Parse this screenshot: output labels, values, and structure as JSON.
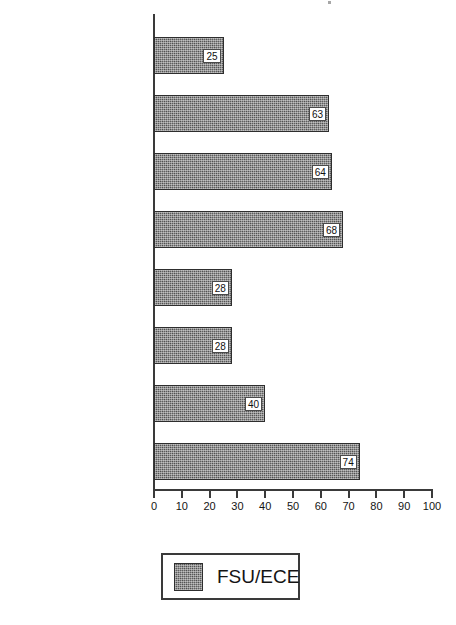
{
  "chart_data": {
    "type": "bar",
    "orientation": "horizontal",
    "title": "",
    "xlabel": "",
    "ylabel": "",
    "categories": [
      "Party values",
      "Electoral values",
      "Populist values",
      "Liberal values",
      "Cultural nationalism",
      "Centralist nationalism",
      "External nationalism",
      "Socialist values"
    ],
    "series": [
      {
        "name": "FSU/ECE",
        "values": [
          25,
          63,
          64,
          68,
          28,
          28,
          40,
          74
        ],
        "color": "#5f5f5f"
      }
    ],
    "values": [
      25,
      63,
      64,
      68,
      28,
      28,
      40,
      74
    ],
    "xlim": [
      0,
      100
    ],
    "xticks": [
      0,
      10,
      20,
      30,
      40,
      50,
      60,
      70,
      80,
      90,
      100
    ],
    "xtick_labels": [
      "0",
      "10",
      "20",
      "30",
      "40",
      "50",
      "60",
      "70",
      "80",
      "90",
      "100"
    ],
    "grid": false,
    "data_labels_shown": true,
    "legend": {
      "position": "bottom",
      "entries": [
        {
          "label": "FSU/ECE",
          "color": "#5f5f5f"
        }
      ]
    }
  },
  "legend": {
    "label": "FSU/ECE"
  }
}
